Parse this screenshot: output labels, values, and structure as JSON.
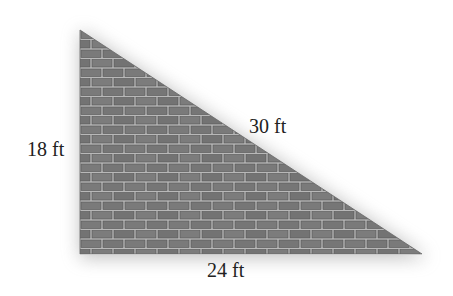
{
  "figure": {
    "type": "right-triangle",
    "fill": "brick-wall",
    "vertices": {
      "right_angle": [
        80,
        254
      ],
      "top": [
        80,
        30
      ],
      "right": [
        422,
        254
      ]
    },
    "colors": {
      "brick": "#7a7a7a",
      "brick_dark": "#5e5e5e",
      "mortar": "#b8b8b8",
      "shadow": "#9a9a9a",
      "text": "#222222"
    }
  },
  "labels": {
    "height": "18 ft",
    "hypotenuse": "30 ft",
    "base": "24 ft"
  },
  "measurements": {
    "height_ft": 18,
    "base_ft": 24,
    "hypotenuse_ft": 30
  }
}
